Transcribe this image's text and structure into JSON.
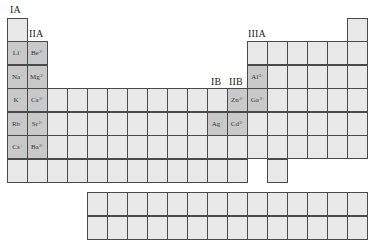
{
  "colors": {
    "cell_fill": "#e8e8e8",
    "ion_cell_fill": "#c9c9c9",
    "border": "#4a4a4a",
    "label": "#222222"
  },
  "group_labels": [
    {
      "text": "IA",
      "x": 10,
      "y": 4
    },
    {
      "text": "IIA",
      "x": 29,
      "y": 28
    },
    {
      "text": "IB",
      "x": 211,
      "y": 76
    },
    {
      "text": "IIB",
      "x": 229,
      "y": 76
    },
    {
      "text": "IIIA",
      "x": 248,
      "y": 28
    }
  ],
  "grid": {
    "origin_x": 7,
    "col_width": 20,
    "row_tops": [
      18,
      41,
      65,
      88,
      112,
      135,
      159
    ],
    "fblock_row_tops": [
      192,
      216
    ],
    "fblock_start_col": 5,
    "fblock_cols": 14
  },
  "ions": [
    {
      "symbol": "Li",
      "charge": "+",
      "period": 2,
      "group": 1
    },
    {
      "symbol": "Be",
      "charge": "2+",
      "period": 2,
      "group": 2
    },
    {
      "symbol": "Na",
      "charge": "+",
      "period": 3,
      "group": 1
    },
    {
      "symbol": "Mg",
      "charge": "2+",
      "period": 3,
      "group": 2
    },
    {
      "symbol": "K",
      "charge": "+",
      "period": 4,
      "group": 1
    },
    {
      "symbol": "Ca",
      "charge": "2+",
      "period": 4,
      "group": 2
    },
    {
      "symbol": "Rb",
      "charge": "+",
      "period": 5,
      "group": 1
    },
    {
      "symbol": "Sr",
      "charge": "2+",
      "period": 5,
      "group": 2
    },
    {
      "symbol": "Cs",
      "charge": "+",
      "period": 6,
      "group": 1
    },
    {
      "symbol": "Ba",
      "charge": "2+",
      "period": 6,
      "group": 2
    },
    {
      "symbol": "Al",
      "charge": "3+",
      "period": 3,
      "group": 13
    },
    {
      "symbol": "Zn",
      "charge": "2+",
      "period": 4,
      "group": 12
    },
    {
      "symbol": "Ga",
      "charge": "3+",
      "period": 4,
      "group": 13
    },
    {
      "symbol": "Ag",
      "charge": "+",
      "period": 5,
      "group": 11
    },
    {
      "symbol": "Cd",
      "charge": "2+",
      "period": 5,
      "group": 12
    }
  ],
  "period_columns": {
    "1": [
      1,
      18
    ],
    "2": [
      1,
      2,
      13,
      14,
      15,
      16,
      17,
      18
    ],
    "3": [
      1,
      2,
      13,
      14,
      15,
      16,
      17,
      18
    ],
    "4": [
      1,
      2,
      3,
      4,
      5,
      6,
      7,
      8,
      9,
      10,
      11,
      12,
      13,
      14,
      15,
      16,
      17,
      18
    ],
    "5": [
      1,
      2,
      3,
      4,
      5,
      6,
      7,
      8,
      9,
      10,
      11,
      12,
      13,
      14,
      15,
      16,
      17,
      18
    ],
    "6": [
      1,
      2,
      3,
      4,
      5,
      6,
      7,
      8,
      9,
      10,
      11,
      12,
      13,
      14,
      15,
      16,
      17,
      18
    ],
    "7": [
      1,
      2,
      3,
      4,
      5,
      6,
      7,
      8,
      9,
      10,
      11,
      12,
      14
    ]
  }
}
